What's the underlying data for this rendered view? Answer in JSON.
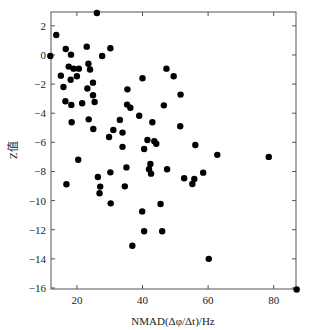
{
  "chart_data": {
    "type": "scatter",
    "title": "",
    "xlabel": "NMAD(Δφ/Δt)/Hz",
    "ylabel": "Z值",
    "xlim": [
      12.1,
      86.8
    ],
    "ylim": [
      -16.07,
      2.95
    ],
    "x_ticks": [
      20,
      40,
      60,
      80
    ],
    "y_ticks": [
      2,
      0,
      -2,
      -4,
      -6,
      -8,
      -10,
      -12,
      -14,
      -16
    ],
    "grid": false,
    "legend": null,
    "marker_color": "#000000",
    "series": [
      {
        "name": "samples",
        "points": [
          [
            26.1,
            2.88
          ],
          [
            13.7,
            1.37
          ],
          [
            11.9,
            -0.07
          ],
          [
            16.6,
            0.41
          ],
          [
            18.2,
            0.02
          ],
          [
            23.0,
            0.57
          ],
          [
            27.7,
            -0.07
          ],
          [
            30.2,
            0.46
          ],
          [
            17.5,
            -0.8
          ],
          [
            19.0,
            -0.94
          ],
          [
            20.6,
            -0.94
          ],
          [
            23.5,
            -0.6
          ],
          [
            24.0,
            -1.0
          ],
          [
            15.1,
            -1.42
          ],
          [
            18.1,
            -1.7
          ],
          [
            20.0,
            -1.46
          ],
          [
            24.9,
            -1.9
          ],
          [
            15.9,
            -2.2
          ],
          [
            23.2,
            -2.3
          ],
          [
            24.9,
            -2.77
          ],
          [
            16.5,
            -3.18
          ],
          [
            18.3,
            -3.43
          ],
          [
            21.6,
            -3.32
          ],
          [
            25.4,
            -3.23
          ],
          [
            35.4,
            -2.36
          ],
          [
            35.3,
            -3.41
          ],
          [
            36.3,
            -3.62
          ],
          [
            18.4,
            -4.62
          ],
          [
            23.6,
            -4.42
          ],
          [
            25.0,
            -5.08
          ],
          [
            33.1,
            -4.46
          ],
          [
            31.1,
            -5.15
          ],
          [
            29.8,
            -5.63
          ],
          [
            33.9,
            -5.33
          ],
          [
            47.3,
            -0.94
          ],
          [
            49.5,
            -1.46
          ],
          [
            40.0,
            -1.6
          ],
          [
            51.6,
            -2.72
          ],
          [
            46.5,
            -3.46
          ],
          [
            39.0,
            -4.17
          ],
          [
            43.0,
            -4.62
          ],
          [
            51.5,
            -4.9
          ],
          [
            41.5,
            -5.84
          ],
          [
            43.6,
            -5.93
          ],
          [
            44.2,
            -6.1
          ],
          [
            33.9,
            -6.31
          ],
          [
            40.5,
            -6.46
          ],
          [
            56.1,
            -6.18
          ],
          [
            62.8,
            -6.86
          ],
          [
            78.5,
            -7.0
          ],
          [
            16.8,
            -8.88
          ],
          [
            20.4,
            -7.19
          ],
          [
            26.4,
            -8.38
          ],
          [
            27.1,
            -9.04
          ],
          [
            26.9,
            -9.5
          ],
          [
            30.2,
            -8.06
          ],
          [
            30.3,
            -10.19
          ],
          [
            35.1,
            -7.72
          ],
          [
            34.6,
            -9.02
          ],
          [
            42.4,
            -7.48
          ],
          [
            42.0,
            -7.85
          ],
          [
            42.6,
            -8.15
          ],
          [
            47.5,
            -7.85
          ],
          [
            52.7,
            -8.47
          ],
          [
            55.8,
            -8.52
          ],
          [
            55.2,
            -8.86
          ],
          [
            58.5,
            -8.08
          ],
          [
            45.5,
            -10.23
          ],
          [
            39.9,
            -10.74
          ],
          [
            40.5,
            -12.1
          ],
          [
            46.0,
            -12.1
          ],
          [
            36.9,
            -13.1
          ],
          [
            60.2,
            -14.0
          ],
          [
            87.0,
            -16.1
          ]
        ]
      }
    ]
  }
}
